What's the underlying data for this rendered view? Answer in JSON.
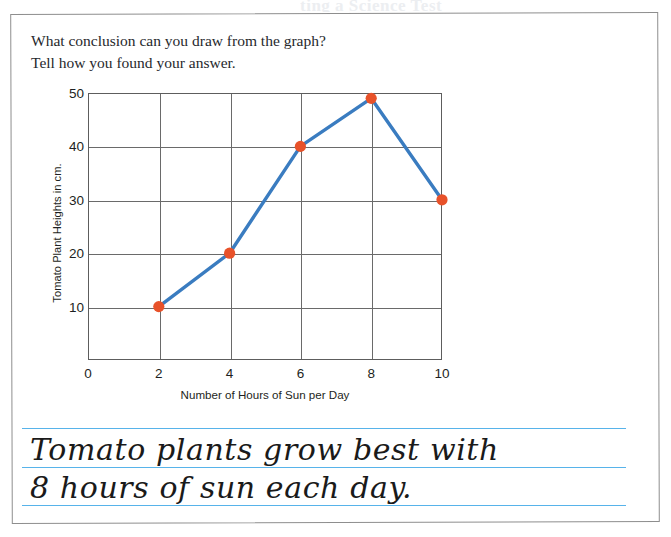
{
  "page": {
    "scan_bleed_text": "ting a Science Test"
  },
  "question": {
    "line1": "What conclusion can you draw from the graph?",
    "line2": "Tell how you found your answer."
  },
  "chart_data": {
    "type": "line",
    "title": "",
    "xlabel": "Number of Hours of Sun per Day",
    "ylabel": "Tomato Plant Heights in cm.",
    "x": [
      2,
      4,
      6,
      8,
      10
    ],
    "values": [
      10,
      20,
      40,
      49,
      30
    ],
    "xlim": [
      0,
      10
    ],
    "ylim": [
      0,
      50
    ],
    "xticks": [
      0,
      2,
      4,
      6,
      8,
      10
    ],
    "yticks": [
      10,
      20,
      30,
      40,
      50
    ],
    "xtick_labels": [
      "0",
      "2",
      "4",
      "6",
      "8",
      "10"
    ],
    "ytick_labels": [
      "10",
      "20",
      "30",
      "40",
      "50"
    ],
    "grid": true,
    "legend": false,
    "line_color": "#3a7cc0",
    "marker_color": "#e8522a",
    "grid_color": "#6a6a6a"
  },
  "answer": {
    "line1": "Tomato plants grow best with",
    "line2": "8 hours of sun each day.",
    "rule_color": "#57b3ea"
  }
}
